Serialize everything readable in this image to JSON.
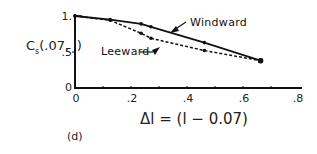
{
  "chart_data": {
    "type": "line",
    "title": "",
    "panel_label": "(d)",
    "xlabel": "Δl = (l − 0.07)",
    "ylabel": "C_s(.07, l)",
    "ylabel_main": "C",
    "ylabel_sub": "s",
    "ylabel_rest": "(.07, l)",
    "xlim": [
      0,
      0.8
    ],
    "ylim": [
      0,
      1.0
    ],
    "x_ticks": [
      "0",
      ".2",
      ".4",
      ".6",
      ".8"
    ],
    "y_ticks": [
      "0",
      ".5",
      "1."
    ],
    "grid": false,
    "legend_position": "inline annotations with arrows",
    "series": [
      {
        "name": "Windward",
        "style": "solid",
        "points": [
          [
            0,
            1.0
          ],
          [
            0.125,
            0.95
          ],
          [
            0.235,
            0.89
          ],
          [
            0.27,
            0.85
          ],
          [
            0.46,
            0.63
          ],
          [
            0.66,
            0.38
          ]
        ]
      },
      {
        "name": "Leeward",
        "style": "dashed",
        "points": [
          [
            0,
            1.0
          ],
          [
            0.125,
            0.94
          ],
          [
            0.235,
            0.76
          ],
          [
            0.27,
            0.69
          ],
          [
            0.46,
            0.52
          ],
          [
            0.66,
            0.38
          ]
        ]
      }
    ]
  }
}
